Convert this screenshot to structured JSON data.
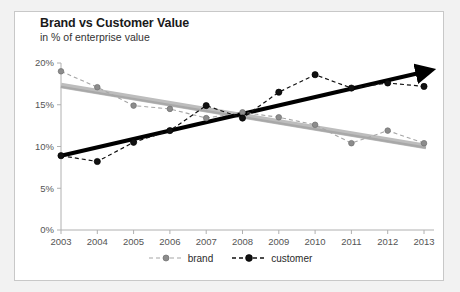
{
  "chart_data": {
    "type": "line",
    "title": "Brand vs Customer Value",
    "subtitle": "in % of enterprise value",
    "xlabel": "",
    "ylabel": "",
    "ylim": [
      0,
      20
    ],
    "ytick_labels": [
      "0%",
      "5%",
      "10%",
      "15%",
      "20%"
    ],
    "ytick_values": [
      0,
      5,
      10,
      15,
      20
    ],
    "grid": false,
    "legend_position": "bottom-center",
    "categories": [
      "2003",
      "2004",
      "2005",
      "2006",
      "2007",
      "2008",
      "2009",
      "2010",
      "2011",
      "2012",
      "2013"
    ],
    "series": [
      {
        "name": "brand",
        "color": "#a6a6a6",
        "style": "dashed-markers",
        "values": [
          19.0,
          17.1,
          14.9,
          14.5,
          13.4,
          14.1,
          13.5,
          12.6,
          10.4,
          11.9,
          10.4
        ],
        "trendline": {
          "name": "brand trend",
          "color": "#bdbdbd",
          "arrow": false,
          "start_value": 17.3,
          "end_value": 10.0
        }
      },
      {
        "name": "customer",
        "color": "#111111",
        "style": "dashed-markers",
        "values": [
          8.9,
          8.2,
          10.5,
          11.9,
          14.9,
          13.4,
          16.5,
          18.6,
          17.0,
          17.6,
          17.2
        ],
        "trendline": {
          "name": "customer trend",
          "color": "#000000",
          "arrow": true,
          "start_value": 8.9,
          "end_value": 19.1
        }
      }
    ]
  },
  "legend": {
    "items": [
      {
        "label": "brand"
      },
      {
        "label": "customer"
      }
    ]
  },
  "colors": {
    "background": "#f2f2f2",
    "panel": "#ffffff",
    "border": "#c8c8c8",
    "brand": "#a6a6a6",
    "customer": "#111111",
    "axis": "#b0b0b0",
    "text": "#333333"
  }
}
